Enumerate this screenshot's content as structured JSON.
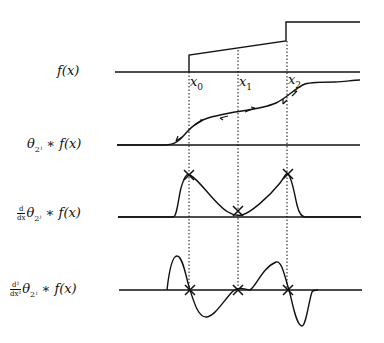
{
  "figure": {
    "rows": [
      {
        "label": "f(x)",
        "label_prefix": "",
        "label_main": "f(x)"
      },
      {
        "label": "θ_{2^j} * f(x)",
        "label_theta": "θ",
        "label_sub": "2ʲ",
        "label_rest": " ∗ f(x)"
      },
      {
        "label": "d/dx θ_{2^j} * f(x)",
        "frac_num": "d",
        "frac_den": "dx",
        "label_theta": "θ",
        "label_sub": "2ʲ",
        "label_rest": " ∗ f(x)"
      },
      {
        "label": "d²/dx² θ_{2^j} * f(x)",
        "frac_num": "d²",
        "frac_den": "dx²",
        "label_theta": "θ",
        "label_sub": "2ʲ",
        "label_rest": " ∗ f(x)"
      }
    ],
    "ticks": [
      {
        "var": "x",
        "sub": "0"
      },
      {
        "var": "x",
        "sub": "1"
      },
      {
        "var": "x",
        "sub": "2"
      }
    ],
    "colors": {
      "stroke": "#111111",
      "background": "#ffffff"
    }
  }
}
